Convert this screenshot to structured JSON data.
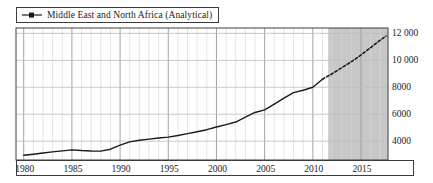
{
  "chart_data": {
    "type": "line",
    "title": "",
    "xlabel": "",
    "ylabel": "",
    "xlim": [
      1979.2,
      2017.8
    ],
    "ylim": [
      2600,
      12400
    ],
    "grid": true,
    "legend_position": "top-left",
    "legend": [
      {
        "name": "Middle East and North Africa (Analytical)",
        "marker": "line-with-square",
        "color": "#1a1a1a"
      }
    ],
    "xticks": [
      "1980",
      "1985",
      "1990",
      "1995",
      "2000",
      "2005",
      "2010",
      "2015"
    ],
    "xtick_values": [
      1980,
      1985,
      1990,
      1995,
      2000,
      2005,
      2010,
      2015
    ],
    "yticks": [
      "4000",
      "6000",
      "8000",
      "10 000",
      "12 000"
    ],
    "ytick_values": [
      4000,
      6000,
      8000,
      10000,
      12000
    ],
    "annotations": [
      {
        "label": "forecast-shading",
        "type": "shaded-region",
        "x_start": 2011.6,
        "x_end": 2017.8,
        "color": "#c8c8c8"
      }
    ],
    "series": [
      {
        "name": "Middle East and North Africa (Analytical)",
        "style": "solid",
        "segment": "historical",
        "x": [
          1980,
          1981,
          1982,
          1983,
          1984,
          1985,
          1986,
          1987,
          1988,
          1989,
          1990,
          1991,
          1992,
          1993,
          1994,
          1995,
          1996,
          1997,
          1998,
          1999,
          2000,
          2001,
          2002,
          2003,
          2004,
          2005,
          2006,
          2007,
          2008,
          2009,
          2010,
          2011
        ],
        "values": [
          2950,
          3030,
          3120,
          3200,
          3280,
          3350,
          3300,
          3270,
          3260,
          3400,
          3700,
          3950,
          4070,
          4150,
          4230,
          4300,
          4420,
          4560,
          4700,
          4850,
          5050,
          5230,
          5420,
          5780,
          6130,
          6320,
          6750,
          7200,
          7600,
          7780,
          8000,
          8600
        ]
      },
      {
        "name": "Middle East and North Africa (Analytical)",
        "style": "dashed",
        "segment": "projection",
        "x": [
          2011,
          2012,
          2013,
          2014,
          2015,
          2016,
          2017,
          2017.6
        ],
        "values": [
          8600,
          9000,
          9450,
          9900,
          10400,
          10950,
          11500,
          11800
        ]
      }
    ]
  },
  "legend": {
    "label": "Middle East and North Africa (Analytical)"
  },
  "axis": {
    "x_labels": [
      "1980",
      "1985",
      "1990",
      "1995",
      "2000",
      "2005",
      "2010",
      "2015"
    ],
    "y_labels": [
      "12 000",
      "10 000",
      "8000",
      "6000",
      "4000"
    ]
  }
}
